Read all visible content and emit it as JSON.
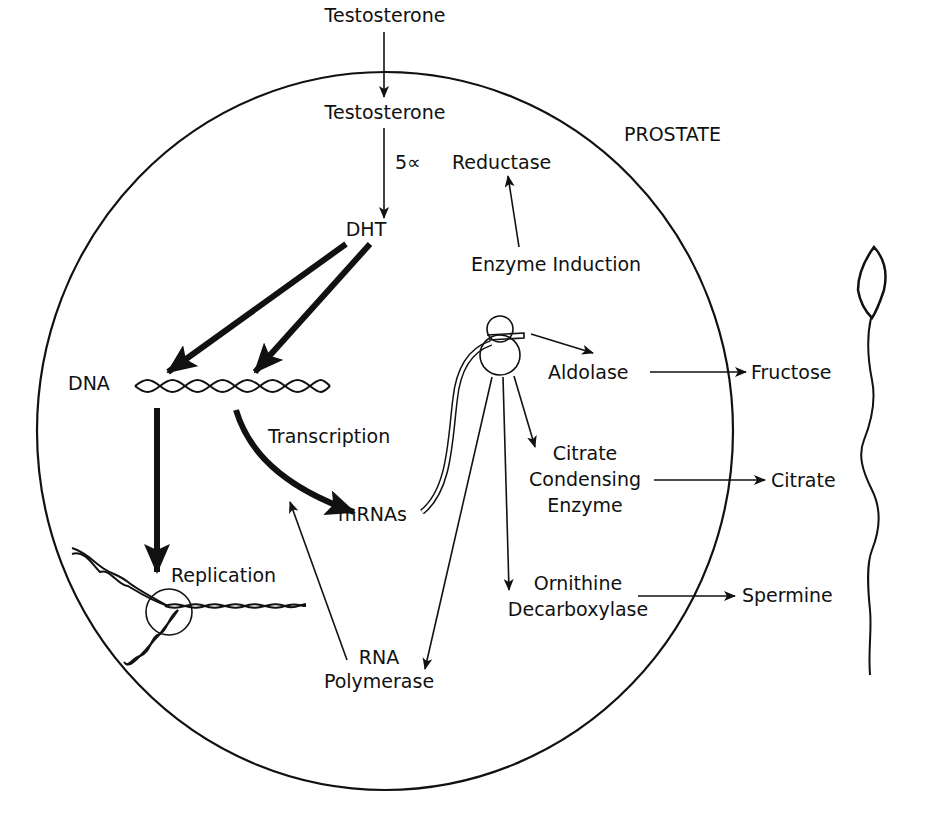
{
  "diagram": {
    "region_label": "PROSTATE",
    "labels": {
      "testosterone_outside": "Testosterone",
      "testosterone_inside": "Testosterone",
      "enzyme_prefix": "5∝",
      "reductase": "Reductase",
      "dht": "DHT",
      "enzyme_induction": "Enzyme Induction",
      "dna": "DNA",
      "transcription": "Transcription",
      "mrnas": "mRNAs",
      "replication": "Replication",
      "rna_polymerase_line1": "RNA",
      "rna_polymerase_line2": "Polymerase",
      "aldolase": "Aldolase",
      "fructose": "Fructose",
      "citrate_condensing_line1": "Citrate",
      "citrate_condensing_line2": "Condensing",
      "citrate_condensing_line3": "Enzyme",
      "citrate": "Citrate",
      "ornithine_line1": "Ornithine",
      "ornithine_line2": "Decarboxylase",
      "spermine": "Spermine"
    },
    "icons": [
      "cell-membrane",
      "dna-helix",
      "replication-fork",
      "ribosome",
      "sperm-cell"
    ],
    "colors": {
      "ink": "#111111",
      "background": "#ffffff"
    }
  }
}
